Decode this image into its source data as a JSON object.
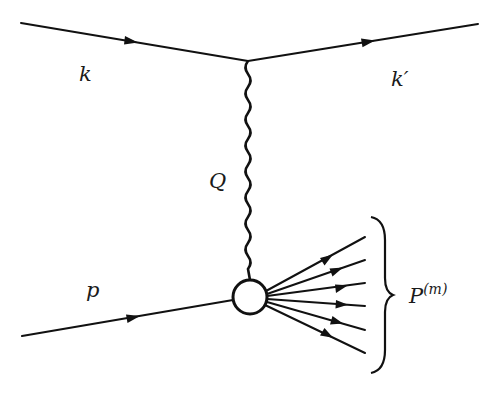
{
  "diagram": {
    "type": "feynman-diagram",
    "colors": {
      "line": "#111111",
      "background": "#ffffff",
      "blob_fill": "#ffffff"
    },
    "labels": {
      "incoming_lepton": "k",
      "outgoing_lepton": "k′",
      "exchanged_boson": "Q",
      "incoming_hadron": "p",
      "final_state_base": "P",
      "final_state_sup": "(m)"
    },
    "vertices": {
      "lepton_vertex": [
        248,
        61
      ],
      "hadron_blob": {
        "center": [
          250,
          297
        ],
        "radius": 17
      }
    },
    "lines": {
      "incoming_lepton": {
        "from": [
          21,
          23
        ],
        "to": [
          248,
          61
        ],
        "arrow": true
      },
      "outgoing_lepton": {
        "from": [
          248,
          61
        ],
        "to": [
          478,
          24
        ],
        "arrow": true
      },
      "incoming_hadron": {
        "from": [
          22,
          336
        ],
        "to": [
          233,
          300
        ],
        "arrow": true
      },
      "photon": {
        "from": [
          248,
          61
        ],
        "to": [
          250,
          280
        ],
        "style": "wavy"
      }
    },
    "final_state_count": 6,
    "final_state_endpoints_y": [
      237,
      260,
      283,
      306,
      330,
      353
    ]
  }
}
